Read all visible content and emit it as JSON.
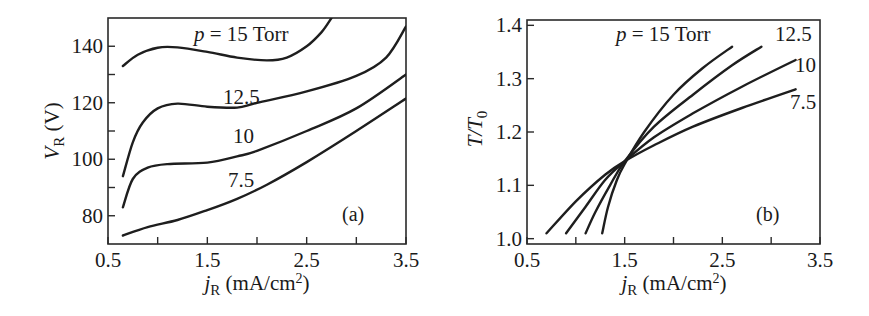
{
  "chart_data": [
    {
      "panel": "(a)",
      "type": "line",
      "title": "",
      "xlabel": "jR (mA/cm2)",
      "ylabel": "VR (V)",
      "xlim": [
        0.5,
        3.5
      ],
      "ylim": [
        70,
        150
      ],
      "xticks": [
        0.5,
        1.0,
        1.5,
        2.0,
        2.5,
        3.0,
        3.5
      ],
      "xtick_labels": [
        "0.5",
        "1.5",
        "2.5",
        "3.5"
      ],
      "xtick_label_values": [
        0.5,
        1.5,
        2.5,
        3.5
      ],
      "yticks": [
        80,
        90,
        100,
        110,
        120,
        130,
        140
      ],
      "ytick_labels": [
        "80",
        "100",
        "120",
        "140"
      ],
      "ytick_label_values": [
        80,
        100,
        120,
        140
      ],
      "grid": false,
      "annotation": "(a)",
      "series": [
        {
          "name": "p = 15 Torr",
          "x": [
            0.65,
            0.8,
            1.0,
            1.2,
            1.5,
            1.8,
            2.1,
            2.3,
            2.5,
            2.65,
            2.75
          ],
          "y": [
            133,
            137,
            139.5,
            139.6,
            138,
            136,
            135,
            136,
            140,
            145,
            150
          ]
        },
        {
          "name": "12.5",
          "x": [
            0.65,
            0.75,
            0.85,
            1.0,
            1.2,
            1.5,
            1.8,
            2.0,
            2.5,
            3.0,
            3.3,
            3.5
          ],
          "y": [
            94,
            106,
            113,
            118,
            119.7,
            118.6,
            118.3,
            120,
            124,
            129.5,
            136,
            147
          ]
        },
        {
          "name": "10",
          "x": [
            0.65,
            0.75,
            0.9,
            1.1,
            1.5,
            1.8,
            2.0,
            2.5,
            3.0,
            3.5
          ],
          "y": [
            83,
            93,
            97,
            98.3,
            98.8,
            101,
            103,
            110,
            118,
            130
          ]
        },
        {
          "name": "7.5",
          "x": [
            0.65,
            0.9,
            1.2,
            1.5,
            1.8,
            2.1,
            2.5,
            3.0,
            3.5
          ],
          "y": [
            73,
            76,
            78.5,
            82,
            86,
            91,
            99,
            110,
            121.5
          ]
        }
      ],
      "curve_labels": [
        {
          "text": "p = 15 Torr",
          "x": 1.37,
          "y": 145.5
        },
        {
          "text": "12.5",
          "x": 1.52,
          "y": 122
        },
        {
          "text": "10",
          "x": 1.5,
          "y": 109.5
        },
        {
          "text": "7.5",
          "x": 1.5,
          "y": 91.5
        }
      ]
    },
    {
      "panel": "(b)",
      "type": "line",
      "title": "",
      "xlabel": "jR (mA/cm2)",
      "ylabel": "T/T0",
      "xlim": [
        0.5,
        3.5
      ],
      "ylim": [
        0.99,
        1.41
      ],
      "xticks": [
        0.5,
        1.0,
        1.5,
        2.0,
        2.5,
        3.0,
        3.5
      ],
      "xtick_labels": [
        "0.5",
        "1.5",
        "2.5",
        "3.5"
      ],
      "xtick_label_values": [
        0.5,
        1.5,
        2.5,
        3.5
      ],
      "yticks": [
        1.0,
        1.1,
        1.2,
        1.3,
        1.4
      ],
      "ytick_labels": [
        "1.0",
        "1.1",
        "1.2",
        "1.3",
        "1.4"
      ],
      "ytick_label_values": [
        1.0,
        1.1,
        1.2,
        1.3,
        1.4
      ],
      "grid": false,
      "annotation": "(b)",
      "series": [
        {
          "name": "p = 15 Torr",
          "x": [
            1.27,
            1.33,
            1.42,
            1.5,
            1.7,
            2.0,
            2.3,
            2.6
          ],
          "y": [
            1.01,
            1.06,
            1.11,
            1.14,
            1.2,
            1.27,
            1.32,
            1.36
          ]
        },
        {
          "name": "12.5",
          "x": [
            1.1,
            1.2,
            1.35,
            1.5,
            1.8,
            2.2,
            2.6,
            2.9
          ],
          "y": [
            1.01,
            1.05,
            1.1,
            1.145,
            1.21,
            1.27,
            1.325,
            1.36
          ]
        },
        {
          "name": "10",
          "x": [
            0.9,
            1.1,
            1.3,
            1.5,
            1.8,
            2.2,
            2.7,
            3.25
          ],
          "y": [
            1.01,
            1.06,
            1.11,
            1.145,
            1.19,
            1.235,
            1.285,
            1.335
          ]
        },
        {
          "name": "7.5",
          "x": [
            0.7,
            1.0,
            1.3,
            1.5,
            1.8,
            2.2,
            2.7,
            3.25
          ],
          "y": [
            1.01,
            1.07,
            1.12,
            1.145,
            1.175,
            1.21,
            1.245,
            1.28
          ]
        }
      ],
      "curve_labels": [
        {
          "text": "p = 15 Torr",
          "x": 1.35,
          "y": 1.36
        },
        {
          "text": "12.5",
          "x": 3.3,
          "y": 1.36
        },
        {
          "text": "10",
          "x": 3.32,
          "y": 1.31
        },
        {
          "text": "7.5",
          "x": 3.3,
          "y": 1.26
        }
      ]
    }
  ],
  "panels": {
    "a": {
      "ylabel_main": "V",
      "ylabel_sub": "R",
      "ylabel_unit": " (V)",
      "xlabel_main": "j",
      "xlabel_sub": "R",
      "xlabel_unit": " (mA/cm",
      "xlabel_sup": "2",
      "xlabel_close": ")",
      "tag": "(a)",
      "label_15_italic": "p",
      "label_15_rest": " = 15 Torr",
      "label_125": "12.5",
      "label_10": "10",
      "label_75": "7.5"
    },
    "b": {
      "ylabel_main": "T/T",
      "ylabel_sub": "0",
      "xlabel_main": "j",
      "xlabel_sub": "R",
      "xlabel_unit": " (mA/cm",
      "xlabel_sup": "2",
      "xlabel_close": ")",
      "tag": "(b)",
      "label_15_italic": "p",
      "label_15_rest": " = 15 Torr",
      "label_125": "12.5",
      "label_10": "10",
      "label_75": "7.5"
    }
  }
}
